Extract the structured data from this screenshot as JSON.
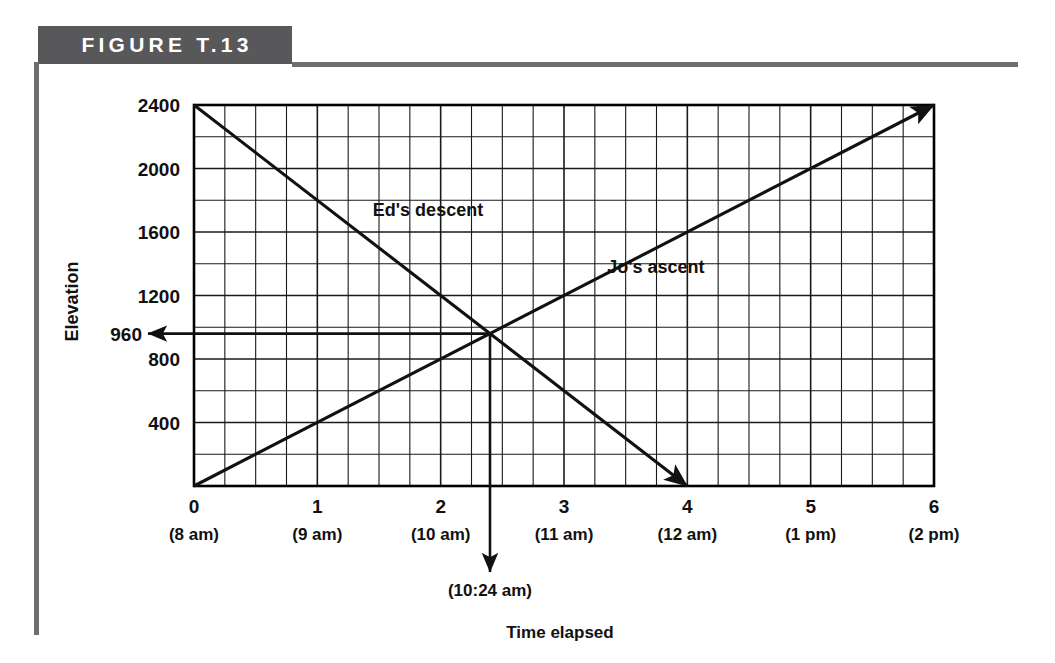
{
  "figure": {
    "banner_label": "FIGURE T.13"
  },
  "chart_data": {
    "type": "line",
    "title": "FIGURE T.13",
    "xlabel": "Time elapsed",
    "ylabel": "Elevation",
    "xlim": [
      0,
      6
    ],
    "ylim": [
      0,
      2400
    ],
    "grid": true,
    "grid_step_x": 0.25,
    "grid_step_y": 200,
    "legend": "inline-labels",
    "x_ticks": [
      {
        "value": 0,
        "label": "0",
        "sublabel": "(8 am)"
      },
      {
        "value": 1,
        "label": "1",
        "sublabel": "(9 am)"
      },
      {
        "value": 2,
        "label": "2",
        "sublabel": "(10 am)"
      },
      {
        "value": 3,
        "label": "3",
        "sublabel": "(11 am)"
      },
      {
        "value": 4,
        "label": "4",
        "sublabel": "(12 am)"
      },
      {
        "value": 5,
        "label": "5",
        "sublabel": "(1 pm)"
      },
      {
        "value": 6,
        "label": "6",
        "sublabel": "(2 pm)"
      }
    ],
    "y_ticks": [
      {
        "value": 2400,
        "label": "2400"
      },
      {
        "value": 2000,
        "label": "2000"
      },
      {
        "value": 1600,
        "label": "1600"
      },
      {
        "value": 1200,
        "label": "1200"
      },
      {
        "value": 800,
        "label": "800"
      },
      {
        "value": 400,
        "label": "400"
      }
    ],
    "y_marker": {
      "value": 960,
      "label": "960"
    },
    "series": [
      {
        "name": "Ed's descent",
        "label": "Ed's descent",
        "points": [
          {
            "x": 0,
            "y": 2400
          },
          {
            "x": 4,
            "y": 0
          }
        ],
        "arrow": "end",
        "label_x": 1.45,
        "label_y": 1700
      },
      {
        "name": "Jo's ascent",
        "label": "Jo's ascent",
        "points": [
          {
            "x": 0,
            "y": 0
          },
          {
            "x": 6,
            "y": 2400
          }
        ],
        "arrow": "end",
        "label_x": 3.35,
        "label_y": 1340
      }
    ],
    "annotations": [
      {
        "name": "intersection",
        "x": 2.4,
        "y": 960,
        "x_label": "(10:24 am)",
        "y_label": "960"
      }
    ],
    "x_drop_label": "(10:24 am)"
  }
}
